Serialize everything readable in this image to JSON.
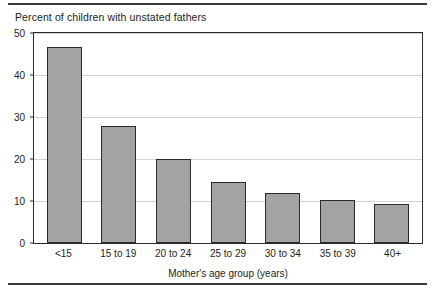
{
  "figure": {
    "title": "Percent of children with unstated fathers",
    "bar_fill_color": "#a3a3a3",
    "bar_edge_color": "#2b2b2b",
    "gridline_color": "#d2d2d2",
    "rule_color": "#3a3a3a"
  },
  "chart_data": {
    "type": "bar",
    "title": "Percent of children with unstated fathers",
    "xlabel": "Mother's age group (years)",
    "ylabel": "",
    "categories": [
      "<15",
      "15 to 19",
      "20 to 24",
      "25 to 29",
      "30 to 34",
      "35 to 39",
      "40+"
    ],
    "values": [
      46.6,
      27.9,
      20.0,
      14.6,
      12.0,
      10.3,
      9.3
    ],
    "ylim": [
      0,
      50
    ],
    "yticks": [
      0,
      10,
      20,
      30,
      40,
      50
    ],
    "ytick_labels": [
      "0",
      "10",
      "20",
      "30",
      "40",
      "50"
    ],
    "grid": true,
    "legend": false
  }
}
